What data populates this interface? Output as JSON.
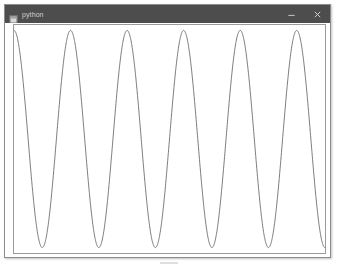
{
  "window": {
    "title": "python",
    "icon": "python-app-icon",
    "controls": [
      {
        "name": "minimize-button",
        "glyph": "–",
        "label": "Minimize"
      },
      {
        "name": "close-button",
        "glyph": "×",
        "label": "Close"
      }
    ]
  },
  "figure": {
    "background_color": "#ffffff",
    "frame_color": "#9b9b9b",
    "line_color": "#5a5a5a",
    "has_ticks": false,
    "has_axis_labels": false,
    "has_title": false,
    "has_legend": false,
    "has_grid": false
  },
  "chart_data": {
    "type": "line",
    "title": "",
    "xlabel": "",
    "ylabel": "",
    "grid": false,
    "legend": null,
    "xlim": [
      0,
      5.5
    ],
    "ylim": [
      -1.05,
      1.05
    ],
    "ticks": {
      "x": [],
      "y": []
    },
    "series": [
      {
        "name": "cos wave",
        "color": "#5a5a5a",
        "description": "sinusoid, amplitude 1, period 1 x-unit, 5.5 cycles shown, starting near maximum then descending",
        "function": "cos(2*pi*x)",
        "amplitude": 1.0,
        "period": 1.0,
        "cycles_visible": 5.5,
        "peaks_x": [
          0.0,
          1.0,
          2.0,
          3.0,
          4.0,
          5.0
        ],
        "troughs_x": [
          0.5,
          1.5,
          2.5,
          3.5,
          4.5
        ],
        "x": [
          0.0,
          0.05,
          0.1,
          0.15,
          0.2,
          0.25,
          0.3,
          0.35,
          0.4,
          0.45,
          0.5,
          0.55,
          0.6,
          0.65,
          0.7,
          0.75,
          0.8,
          0.85,
          0.9,
          0.95,
          1.0,
          1.25,
          1.5,
          1.75,
          2.0,
          2.25,
          2.5,
          2.75,
          3.0,
          3.25,
          3.5,
          3.75,
          4.0,
          4.25,
          4.5,
          4.75,
          5.0,
          5.25,
          5.5
        ],
        "y": [
          1.0,
          0.951,
          0.809,
          0.588,
          0.309,
          0.0,
          -0.309,
          -0.588,
          -0.809,
          -0.951,
          -1.0,
          -0.951,
          -0.809,
          -0.588,
          -0.309,
          0.0,
          0.309,
          0.588,
          0.809,
          0.951,
          1.0,
          0.0,
          -1.0,
          0.0,
          1.0,
          0.0,
          -1.0,
          0.0,
          1.0,
          0.0,
          -1.0,
          0.0,
          1.0,
          0.0,
          -1.0,
          0.0,
          1.0,
          0.0,
          -1.0
        ]
      }
    ]
  }
}
